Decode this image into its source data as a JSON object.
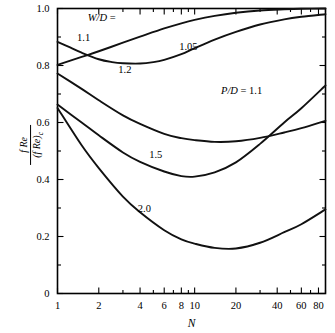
{
  "chart_data": {
    "type": "line",
    "title": "",
    "xlabel": "N",
    "ylabel": "f Re / (f Re)c",
    "ylabel_numerator": "f Re",
    "ylabel_denominator": "(f Re)",
    "ylabel_denominator_sub": "c",
    "xscale": "log",
    "yscale": "linear",
    "xlim": [
      1,
      90
    ],
    "ylim": [
      0,
      1.0
    ],
    "grid": false,
    "legend": "inline-curve-labels",
    "annotations": [
      {
        "text": "W/D =",
        "x": 2.1,
        "y": 0.955
      },
      {
        "text": "P/D = 1.1",
        "x": 22.0,
        "y": 0.7
      }
    ],
    "x_major_ticks": [
      1,
      2,
      4,
      6,
      8,
      10,
      20,
      40,
      60,
      80
    ],
    "x_major_tick_labels": [
      "1",
      "2",
      "4",
      "6",
      "8",
      "10",
      "20",
      "40",
      "60",
      "80"
    ],
    "x_minor_ticks": [
      3,
      5,
      7,
      9,
      30,
      50,
      70,
      90
    ],
    "y_major_ticks": [
      0,
      0.2,
      0.4,
      0.6,
      0.8,
      1.0
    ],
    "y_major_tick_labels": [
      "0",
      "0.2",
      "0.4",
      "0.6",
      "0.8",
      "1.0"
    ],
    "y_minor_ticks": [
      0.1,
      0.3,
      0.5,
      0.7,
      0.9
    ],
    "series": [
      {
        "name": "1.05",
        "label": "1.05",
        "label_x": 9.0,
        "label_y": 0.855,
        "x": [
          1,
          1.2,
          1.5,
          2,
          2.5,
          3,
          4,
          5,
          6,
          8,
          10,
          14,
          20,
          30,
          45,
          60,
          90
        ],
        "y": [
          0.883,
          0.866,
          0.845,
          0.822,
          0.812,
          0.808,
          0.807,
          0.812,
          0.82,
          0.84,
          0.861,
          0.891,
          0.918,
          0.944,
          0.962,
          0.971,
          0.98
        ]
      },
      {
        "name": "1.1",
        "label": "1.1",
        "label_x": 1.55,
        "label_y": 0.885,
        "x": [
          1,
          1.5,
          2,
          3,
          4,
          6,
          8,
          10,
          14,
          20,
          30,
          45,
          60,
          90
        ],
        "y": [
          0.802,
          0.83,
          0.85,
          0.88,
          0.901,
          0.93,
          0.948,
          0.96,
          0.974,
          0.985,
          0.993,
          0.997,
          0.999,
          1.0
        ]
      },
      {
        "name": "1.2",
        "label": "1.2",
        "label_x": 3.1,
        "label_y": 0.775,
        "x": [
          1,
          1.5,
          2,
          3,
          4,
          6,
          8,
          10,
          14,
          20,
          30,
          45,
          60,
          90
        ],
        "y": [
          0.772,
          0.718,
          0.678,
          0.625,
          0.595,
          0.56,
          0.545,
          0.538,
          0.532,
          0.534,
          0.546,
          0.565,
          0.58,
          0.606
        ]
      },
      {
        "name": "1.5",
        "label": "1.5",
        "label_x": 5.2,
        "label_y": 0.475,
        "x": [
          1,
          1.5,
          2,
          3,
          4,
          6,
          8,
          10,
          14,
          20,
          30,
          45,
          60,
          90
        ],
        "y": [
          0.663,
          0.6,
          0.555,
          0.495,
          0.462,
          0.428,
          0.412,
          0.41,
          0.425,
          0.46,
          0.525,
          0.6,
          0.65,
          0.73
        ]
      },
      {
        "name": "2.0",
        "label": "2.0",
        "label_x": 4.3,
        "label_y": 0.285,
        "x": [
          1,
          1.5,
          2,
          3,
          4,
          6,
          8,
          10,
          14,
          20,
          30,
          45,
          60,
          90
        ],
        "y": [
          0.651,
          0.52,
          0.44,
          0.34,
          0.285,
          0.222,
          0.19,
          0.175,
          0.16,
          0.158,
          0.178,
          0.215,
          0.243,
          0.295
        ]
      }
    ]
  }
}
